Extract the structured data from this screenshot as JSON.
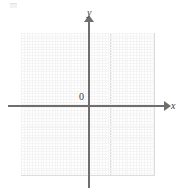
{
  "figure": {
    "type": "coordinate-plane",
    "title": "",
    "axis_labels": {
      "x": "x",
      "y": "y"
    },
    "origin_label": "0",
    "colors": {
      "axis": "#6e6e6e",
      "major_grid": "#dcdcdc",
      "minor_grid": "#f4f4f4",
      "background": "#ffffff",
      "text": "#3a3a3a"
    }
  },
  "chart_data": {
    "type": "scatter",
    "title": "",
    "subtitle": "",
    "xlabel": "x",
    "ylabel": "y",
    "series": [],
    "x": [],
    "categories": [],
    "values": [],
    "xlim": [
      -6,
      6
    ],
    "ylim": [
      -7,
      6
    ],
    "xticks": [],
    "yticks": [],
    "xticklabels": [],
    "yticklabels": [],
    "grid": true,
    "grid_columns": 12,
    "grid_rows": 13,
    "legend": null,
    "legend_position": "none",
    "annotations": [
      {
        "text": "y",
        "role": "y-axis-label"
      },
      {
        "text": "x",
        "role": "x-axis-label"
      },
      {
        "text": "0",
        "role": "origin-label"
      }
    ]
  }
}
